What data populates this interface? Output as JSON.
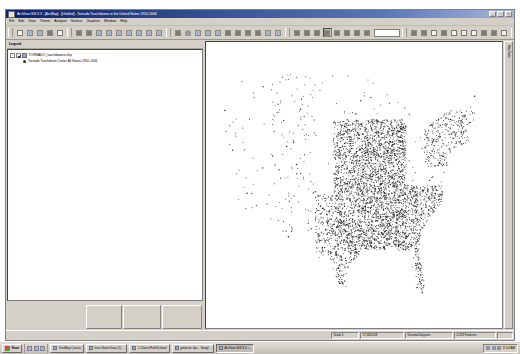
{
  "window": {
    "title": "ArcView GIS 3.3 - [ArcMap] - [Untitled] - Tornado Touchdowns in the United States 1950-2006",
    "minimize_label": "_",
    "maximize_label": "□",
    "close_label": "×"
  },
  "menu": {
    "items": [
      {
        "label": "File"
      },
      {
        "label": "Edit"
      },
      {
        "label": "View"
      },
      {
        "label": "Theme"
      },
      {
        "label": "Analysis"
      },
      {
        "label": "Surface"
      },
      {
        "label": "Graphics"
      },
      {
        "label": "Window"
      },
      {
        "label": "Help"
      }
    ]
  },
  "toolbars": {
    "groups": [
      {
        "name": "standard",
        "buttons": [
          {
            "icon": "new-document-icon",
            "style": "doc"
          },
          {
            "icon": "open-folder-icon",
            "style": "blue"
          },
          {
            "icon": "save-icon",
            "style": "blue"
          },
          {
            "icon": "print-icon",
            "style": "dark"
          },
          {
            "icon": "page-setup-icon",
            "style": "doc"
          }
        ]
      },
      {
        "name": "theme-tools",
        "buttons": [
          {
            "icon": "add-theme-icon",
            "style": "dark"
          },
          {
            "icon": "theme-properties-icon",
            "style": "dark"
          },
          {
            "icon": "legend-editor-icon",
            "style": "blue"
          },
          {
            "icon": "open-table-icon",
            "style": "blue"
          },
          {
            "icon": "query-builder-icon",
            "style": "blue"
          },
          {
            "icon": "find-icon",
            "style": "blue"
          },
          {
            "icon": "locate-address-icon",
            "style": "blue"
          },
          {
            "icon": "join-icon",
            "style": "blue"
          },
          {
            "icon": "summarize-icon",
            "style": "blue"
          }
        ]
      },
      {
        "name": "selection",
        "buttons": [
          {
            "icon": "clear-selection-icon",
            "style": "dark"
          },
          {
            "icon": "heart-symbol-icon",
            "style": "heart"
          },
          {
            "icon": "select-features-icon",
            "style": "blue"
          },
          {
            "icon": "select-by-theme-icon",
            "style": "blue"
          },
          {
            "icon": "buffer-icon",
            "style": "blue"
          },
          {
            "icon": "geoprocessing-icon",
            "style": "dark"
          },
          {
            "icon": "chart-icon",
            "style": "dark"
          },
          {
            "icon": "layout-icon",
            "style": "dark"
          },
          {
            "icon": "script-icon",
            "style": "dark"
          },
          {
            "icon": "hotlink-icon",
            "style": "blue"
          },
          {
            "icon": "measure-icon",
            "style": "blue"
          }
        ]
      },
      {
        "name": "navigation",
        "buttons": [
          {
            "icon": "pointer-icon",
            "style": "dark"
          },
          {
            "icon": "vertex-edit-icon",
            "style": "dark"
          },
          {
            "icon": "label-icon",
            "style": "dark"
          },
          {
            "icon": "zoom-in-icon",
            "style": "dark",
            "pressed": true
          },
          {
            "icon": "zoom-out-icon",
            "style": "dark"
          },
          {
            "icon": "pan-icon",
            "style": "dark"
          },
          {
            "icon": "identify-icon",
            "style": "dark"
          },
          {
            "icon": "full-extent-icon",
            "style": "dark"
          }
        ]
      },
      {
        "name": "draw",
        "buttons": [
          {
            "icon": "draw-point-icon",
            "style": "dark"
          },
          {
            "icon": "draw-circle-icon",
            "style": "dark"
          },
          {
            "icon": "draw-rectangle-icon",
            "style": "doc"
          },
          {
            "icon": "text-tool-icon",
            "style": "dark"
          },
          {
            "icon": "callout-icon",
            "style": "doc"
          },
          {
            "icon": "neatline-icon",
            "style": "doc"
          },
          {
            "icon": "north-arrow-icon",
            "style": "doc"
          },
          {
            "icon": "scalebar-icon",
            "style": "dark"
          },
          {
            "icon": "legend-frame-icon",
            "style": "dark"
          },
          {
            "icon": "picture-frame-icon",
            "style": "doc"
          }
        ]
      },
      {
        "name": "extras",
        "buttons": [
          {
            "icon": "help-pointer-icon",
            "style": "dark"
          },
          {
            "icon": "extension-icon",
            "style": "dark"
          },
          {
            "icon": "minus-tool-icon",
            "style": "dark"
          },
          {
            "icon": "grid-tool-icon",
            "style": "doc"
          },
          {
            "icon": "plus-tool-icon",
            "style": "dark"
          }
        ]
      }
    ]
  },
  "legend_panel": {
    "header": "Legend",
    "tree": [
      {
        "checked": true,
        "expanded": "-",
        "icon": "point-theme-icon",
        "label": "TORNADO_touchdowns.shp",
        "children": [
          {
            "symbol": "black-dot",
            "label": "Tornado Touchdown Center All States 1950-2006"
          }
        ]
      }
    ],
    "tabs": [
      {
        "name": "view-tab",
        "label": ""
      },
      {
        "name": "table-tab",
        "label": ""
      },
      {
        "name": "chart-tab",
        "label": ""
      }
    ]
  },
  "map": {
    "side_tab_label": "Map Tasks",
    "background_color": "#ffffff",
    "point_color": "#1c1c1c",
    "point_count_label": "",
    "description": "Tornado touchdown points across the contiguous United States"
  },
  "chart_data": {
    "type": "scatter",
    "title": "Tornado Touchdowns in the United States 1950-2006",
    "xlabel": "Longitude",
    "ylabel": "Latitude",
    "xlim": [
      -125,
      -66
    ],
    "ylim": [
      24,
      50
    ],
    "series": [
      {
        "name": "Tornado Touchdown Center All States 1950-2006",
        "color": "#1c1c1c",
        "marker": "dot",
        "point_count": 4200,
        "density_regions": [
          {
            "region": "Great Plains / Tornado Alley",
            "lon": [
              -100,
              -94
            ],
            "lat": [
              30,
              44
            ],
            "density": "very-high"
          },
          {
            "region": "Midwest",
            "lon": [
              -94,
              -84
            ],
            "lat": [
              36,
              44
            ],
            "density": "very-high"
          },
          {
            "region": "Deep South / Dixie Alley",
            "lon": [
              -94,
              -84
            ],
            "lat": [
              30,
              36
            ],
            "density": "very-high"
          },
          {
            "region": "Southeast Atlantic",
            "lon": [
              -84,
              -76
            ],
            "lat": [
              30,
              37
            ],
            "density": "high"
          },
          {
            "region": "Northeast",
            "lon": [
              -80,
              -69
            ],
            "lat": [
              39,
              45
            ],
            "density": "medium"
          },
          {
            "region": "Florida peninsula",
            "lon": [
              -82,
              -80
            ],
            "lat": [
              25,
              30
            ],
            "density": "high"
          },
          {
            "region": "Texas",
            "lon": [
              -104,
              -94
            ],
            "lat": [
              26,
              36
            ],
            "density": "high"
          },
          {
            "region": "Rocky Mountains",
            "lon": [
              -114,
              -104
            ],
            "lat": [
              32,
              49
            ],
            "density": "low"
          },
          {
            "region": "Great Basin / Southwest",
            "lon": [
              -120,
              -112
            ],
            "lat": [
              32,
              44
            ],
            "density": "very-low"
          },
          {
            "region": "Pacific Coast",
            "lon": [
              -124,
              -120
            ],
            "lat": [
              33,
              49
            ],
            "density": "very-low"
          }
        ]
      }
    ],
    "grid": false,
    "legend_position": "left-panel"
  },
  "statusbar": {
    "cells": [
      {
        "name": "scale-label",
        "text": "Scale 1:"
      },
      {
        "name": "scale-value",
        "text": "17,634,918"
      },
      {
        "name": "coordinate-units",
        "text": "Decimal Degrees"
      },
      {
        "name": "feature-count",
        "text": "4,253 Features"
      },
      {
        "name": "progress",
        "text": ""
      }
    ]
  },
  "taskbar": {
    "start_label": "Start",
    "quick_launch": [
      {
        "icon": "show-desktop-icon"
      },
      {
        "icon": "browser-icon"
      },
      {
        "icon": "mail-icon"
      }
    ],
    "tasks": [
      {
        "icon": "explorer-icon",
        "label": "TornMap Course",
        "active": false
      },
      {
        "icon": "word-icon",
        "label": "Intro Storm Data (1) ...",
        "active": false
      },
      {
        "icon": "folder-icon",
        "label": "C:\\Users\\Path\\Default",
        "active": false
      },
      {
        "icon": "word-icon",
        "label": "gmtw lec.doc - Googl...",
        "active": false
      },
      {
        "icon": "arcview-icon",
        "label": "ArcView GIS 3.3 -...",
        "active": true
      }
    ],
    "tray": {
      "icons": [
        {
          "icon": "volume-icon"
        },
        {
          "icon": "network-icon"
        },
        {
          "icon": "antivirus-icon"
        }
      ],
      "clock": "11:04 AM"
    }
  }
}
